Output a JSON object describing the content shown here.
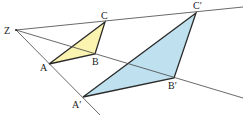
{
  "diagram": {
    "labels": {
      "Z": "Z",
      "A": "A",
      "B": "B",
      "C": "C",
      "A1": "A′",
      "B1": "B′",
      "C1": "C′"
    },
    "points": {
      "Z": [
        16,
        30
      ],
      "A": [
        49,
        64
      ],
      "B": [
        95,
        54
      ],
      "C": [
        105,
        22
      ],
      "A1": [
        83,
        97
      ],
      "B1": [
        174,
        78
      ],
      "C1": [
        196,
        13
      ]
    },
    "colors": {
      "small_fill": "#fbf3b0",
      "large_fill": "#bfe0ee",
      "line": "#333333"
    }
  }
}
